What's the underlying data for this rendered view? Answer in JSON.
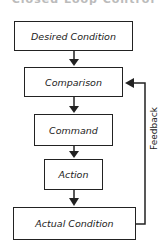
{
  "title": "Closed Loop Control",
  "boxes": [
    {
      "label": "Desired Condition"
    },
    {
      "label": "Comparison"
    },
    {
      "label": "Command"
    },
    {
      "label": "Action"
    },
    {
      "label": "Actual Condition"
    }
  ],
  "feedback_label": "Feedback",
  "colors": {
    "line": "#222222",
    "background": "#ffffff"
  }
}
